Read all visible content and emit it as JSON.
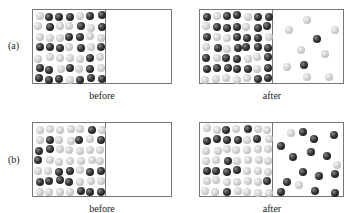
{
  "figure": {
    "rows": [
      {
        "label": "(a)",
        "before_caption": "before",
        "after_caption": "after",
        "description": "Gas mixture in left chamber; after opening, only a few molecules (mostly light) diffuse into the right chamber"
      },
      {
        "label": "(b)",
        "before_caption": "before",
        "after_caption": "after",
        "description": "Gas mixture in left chamber; after opening, many molecules (mostly dark) diffuse into the right chamber"
      }
    ],
    "legend": {
      "dark_molecule_color": "#222222",
      "light_molecule_color": "#cccccc"
    }
  }
}
